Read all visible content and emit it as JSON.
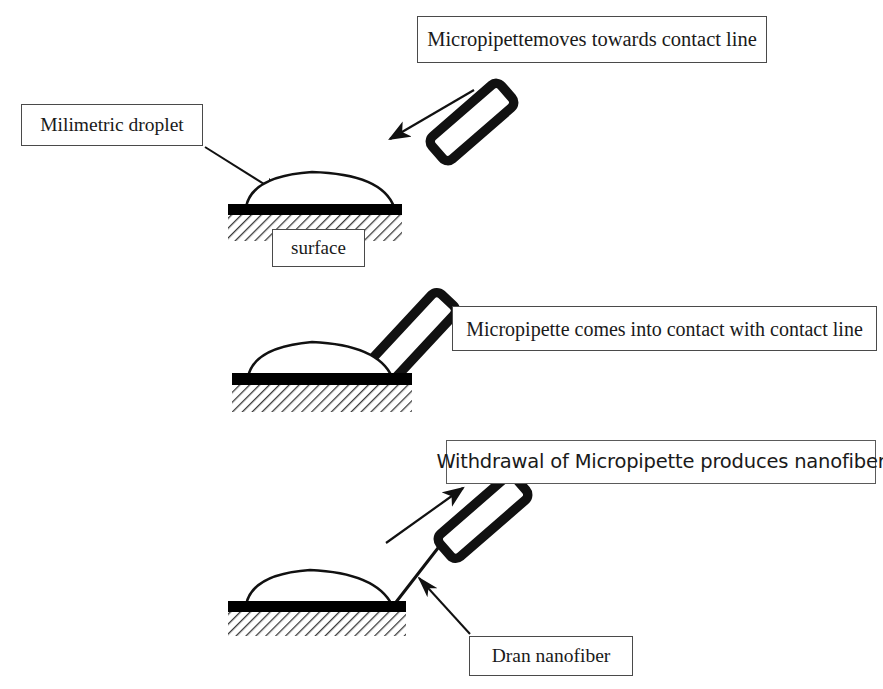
{
  "figure": {
    "background_color": "#ffffff",
    "ink_color": "#000000",
    "box_border_color": "#4a4a4a",
    "width": 883,
    "height": 689
  },
  "labels": {
    "pipette_approach": "Micropipettemoves towards contact line",
    "droplet": "Milimetric droplet",
    "surface": "surface",
    "pipette_contact": "Micropipette comes into contact with contact line",
    "withdrawal": "Withdrawal of Micropipette produces nanofiber",
    "nanofiber": "Dran nanofiber"
  },
  "stages": [
    {
      "index": 1,
      "caption": "Micropipettemoves towards contact line",
      "pipette_state": "approaching",
      "has_nanofiber": false
    },
    {
      "index": 2,
      "caption": "Micropipette comes into contact with contact line",
      "pipette_state": "in-contact",
      "has_nanofiber": false
    },
    {
      "index": 3,
      "caption": "Withdrawal of Micropipette produces nanofiber",
      "pipette_state": "withdrawing",
      "has_nanofiber": true
    }
  ]
}
